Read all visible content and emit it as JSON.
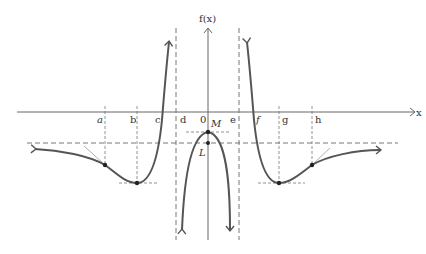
{
  "diagram": {
    "type": "function-graph",
    "y_axis_label": "f(x)",
    "x_axis_label": "x",
    "origin_label": "0",
    "x_markers": [
      "a",
      "b",
      "c",
      "d",
      "e",
      "f",
      "g",
      "h"
    ],
    "point_labels": {
      "max": "M",
      "asymptote_intercept": "L"
    },
    "colors": {
      "curve": "#555555",
      "axis": "#666666",
      "dashed": "#777777",
      "text": "#333333"
    }
  }
}
